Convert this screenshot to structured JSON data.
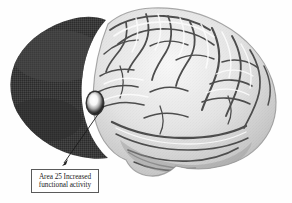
{
  "figure": {
    "background_color": "#fefefe"
  },
  "annotation": {
    "line1": "Area 25 Increased",
    "line2": "functional activity",
    "full_text": "Area 25 Increased functional activity",
    "box_border_color": "#5a5a5a",
    "box_fill_color": "#ffffff",
    "text_color": "#1d1d1d"
  },
  "leader_line": {
    "from_x": 99,
    "from_y": 113,
    "to_x": 63,
    "to_y": 164,
    "color": "#1a1a1a",
    "arrowhead": "filled-triangle"
  },
  "hotspot": {
    "label": "Area 25",
    "center_x": 95,
    "center_y": 103,
    "radius_x": 8,
    "radius_y": 11,
    "core_color": "#ffffff",
    "halo_color": "#2a2a2a"
  },
  "shaded_region": {
    "name": "frontal-shaded-ellipse",
    "fill_color": "#3b3b3b",
    "texture": "halftone-dither"
  },
  "brain": {
    "name": "lateral-brain-surface",
    "light_color": "#f2f2f2",
    "mid_color": "#bdbdbd",
    "sulci_color": "#4a4a4a",
    "shadow_color": "#8c8c8c",
    "outline_color": "#6e6e6e"
  }
}
